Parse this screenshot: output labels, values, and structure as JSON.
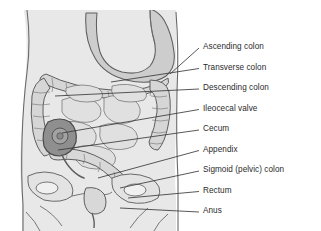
{
  "figure": {
    "background_color": "#ffffff",
    "body_fill": "#e6e6e6",
    "organ_fill": "#d2d2d2",
    "stomach_fill": "#c9c9c9",
    "cecum_fill": "#8e8e8e",
    "outline_color": "#555555",
    "leader_color": "#3a3a3a",
    "text_color": "#2b2b2b"
  },
  "labels": [
    {
      "id": "ascending-colon",
      "text": "Ascending colon",
      "x": 203,
      "y": 48,
      "leader_x1": 170,
      "leader_y1": 74,
      "leader_x2": 199,
      "leader_y2": 48
    },
    {
      "id": "transverse-colon",
      "text": "Transverse colon",
      "x": 203,
      "y": 68.5,
      "leader_x1": 111,
      "leader_y1": 82,
      "leader_x2": 199,
      "leader_y2": 68.5
    },
    {
      "id": "descending-colon",
      "text": "Descending colon",
      "x": 203,
      "y": 89,
      "leader_x1": 55,
      "leader_y1": 96,
      "leader_x2": 199,
      "leader_y2": 89
    },
    {
      "id": "ileocecal-valve",
      "text": "Ileocecal valve",
      "x": 203,
      "y": 109.5,
      "leader_x1": 62,
      "leader_y1": 133,
      "leader_x2": 199,
      "leader_y2": 109.5
    },
    {
      "id": "cecum",
      "text": "Cecum",
      "x": 203,
      "y": 130,
      "leader_x1": 58,
      "leader_y1": 150,
      "leader_x2": 199,
      "leader_y2": 130
    },
    {
      "id": "appendix",
      "text": "Appendix",
      "x": 203,
      "y": 150.5,
      "leader_x1": 98,
      "leader_y1": 178,
      "leader_x2": 199,
      "leader_y2": 150.5
    },
    {
      "id": "sigmoid-pelvic-colon",
      "text": "Sigmoid (pelvic) colon",
      "x": 203,
      "y": 171,
      "leader_x1": 120,
      "leader_y1": 188,
      "leader_x2": 199,
      "leader_y2": 171
    },
    {
      "id": "rectum",
      "text": "Rectum",
      "x": 203,
      "y": 191.5,
      "leader_x1": 128,
      "leader_y1": 198,
      "leader_x2": 199,
      "leader_y2": 191.5
    },
    {
      "id": "anus",
      "text": "Anus",
      "x": 203,
      "y": 212,
      "leader_x1": 120,
      "leader_y1": 208,
      "leader_x2": 199,
      "leader_y2": 212
    }
  ]
}
